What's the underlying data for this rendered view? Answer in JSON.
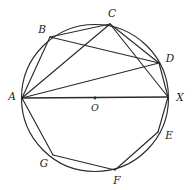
{
  "figure": {
    "background_color": "#ffffff",
    "stroke_color": "#2b2b2b",
    "label_color": "#1a1a1a"
  },
  "circle": {
    "name": "circumscribed-circle",
    "center_x": 95,
    "center_y": 98,
    "radius": 73.5
  },
  "center_point": {
    "label": "O",
    "x": 95,
    "y": 98,
    "label_x": 95,
    "label_y": 108
  },
  "vertices": [
    {
      "label": "A",
      "x": 22,
      "y": 98,
      "label_x": 12,
      "label_y": 97
    },
    {
      "label": "B",
      "x": 50,
      "y": 37,
      "label_x": 42,
      "label_y": 30
    },
    {
      "label": "C",
      "x": 110,
      "y": 24,
      "label_x": 112,
      "label_y": 14
    },
    {
      "label": "D",
      "x": 159,
      "y": 63,
      "label_x": 170,
      "label_y": 59
    },
    {
      "label": "X",
      "x": 168,
      "y": 97,
      "label_x": 180,
      "label_y": 98
    },
    {
      "label": "E",
      "x": 158,
      "y": 132,
      "label_x": 169,
      "label_y": 136
    },
    {
      "label": "F",
      "x": 115,
      "y": 170,
      "label_x": 117,
      "label_y": 181
    },
    {
      "label": "G",
      "x": 53,
      "y": 155,
      "label_x": 44,
      "label_y": 164
    }
  ],
  "segments": [
    {
      "name": "segment-AB",
      "from": "A",
      "to": "B",
      "style": "chord"
    },
    {
      "name": "segment-AC",
      "from": "A",
      "to": "C",
      "style": "chord"
    },
    {
      "name": "segment-AD",
      "from": "A",
      "to": "D",
      "style": "chord"
    },
    {
      "name": "segment-AX",
      "from": "A",
      "to": "X",
      "style": "diameter"
    },
    {
      "name": "segment-AG",
      "from": "A",
      "to": "G",
      "style": "chord"
    },
    {
      "name": "segment-BC",
      "from": "B",
      "to": "C",
      "style": "chord"
    },
    {
      "name": "segment-BD",
      "from": "B",
      "to": "D",
      "style": "chord"
    },
    {
      "name": "segment-CD",
      "from": "C",
      "to": "D",
      "style": "chord"
    },
    {
      "name": "segment-CX",
      "from": "C",
      "to": "X",
      "style": "chord"
    },
    {
      "name": "segment-DX",
      "from": "D",
      "to": "X",
      "style": "chord"
    },
    {
      "name": "segment-XE",
      "from": "X",
      "to": "E",
      "style": "chord"
    },
    {
      "name": "segment-EF",
      "from": "E",
      "to": "F",
      "style": "chord"
    },
    {
      "name": "segment-FG",
      "from": "F",
      "to": "G",
      "style": "chord"
    }
  ]
}
